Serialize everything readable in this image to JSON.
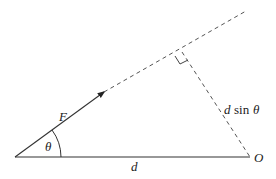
{
  "diagram": {
    "labels": {
      "force": "F",
      "angle": "θ",
      "distance": "d",
      "pivot": "O",
      "perp_var": "d",
      "perp_fn": "sin",
      "perp_angle": "θ"
    },
    "colors": {
      "line": "#333333",
      "dashed": "#555555",
      "background": "#ffffff"
    }
  }
}
